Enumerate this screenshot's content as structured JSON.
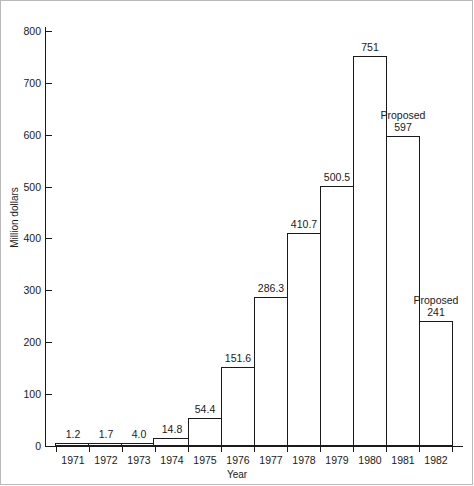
{
  "chart_data": {
    "type": "bar",
    "title": "",
    "xlabel": "Year",
    "ylabel": "Million dollars",
    "categories": [
      "1971",
      "1972",
      "1973",
      "1974",
      "1975",
      "1976",
      "1977",
      "1978",
      "1979",
      "1980",
      "1981",
      "1982"
    ],
    "values": [
      1.2,
      1.7,
      4.0,
      14.8,
      54.4,
      151.6,
      286.3,
      410.7,
      500.5,
      751,
      597,
      241
    ],
    "value_labels": [
      "1.2",
      "1.7",
      "4.0",
      "14.8",
      "54.4",
      "151.6",
      "286.3",
      "410.7",
      "500.5",
      "751",
      "597",
      "241"
    ],
    "annotations": [
      {
        "category": "1981",
        "text": "Proposed"
      },
      {
        "category": "1982",
        "text": "Proposed"
      }
    ],
    "ylim": [
      0,
      800
    ],
    "yticks": [
      0,
      100,
      200,
      300,
      400,
      500,
      600,
      700,
      800
    ],
    "ytick_labels": [
      "0",
      "100",
      "200",
      "300",
      "400",
      "500",
      "600",
      "700",
      "800"
    ],
    "grid": false,
    "legend": "none",
    "bar_style": {
      "fill": "#ffffff",
      "stroke": "#1a1a1a"
    }
  },
  "axis": {
    "y_title": "Million dollars",
    "x_title": "Year"
  },
  "bars": [
    {
      "year": "1971",
      "label": "1.2",
      "note": ""
    },
    {
      "year": "1972",
      "label": "1.7",
      "note": ""
    },
    {
      "year": "1973",
      "label": "4.0",
      "note": ""
    },
    {
      "year": "1974",
      "label": "14.8",
      "note": ""
    },
    {
      "year": "1975",
      "label": "54.4",
      "note": ""
    },
    {
      "year": "1976",
      "label": "151.6",
      "note": ""
    },
    {
      "year": "1977",
      "label": "286.3",
      "note": ""
    },
    {
      "year": "1978",
      "label": "410.7",
      "note": ""
    },
    {
      "year": "1979",
      "label": "500.5",
      "note": ""
    },
    {
      "year": "1980",
      "label": "751",
      "note": ""
    },
    {
      "year": "1981",
      "label": "597",
      "note": "Proposed"
    },
    {
      "year": "1982",
      "label": "241",
      "note": "Proposed"
    }
  ],
  "yticks": [
    {
      "label": "800"
    },
    {
      "label": "700"
    },
    {
      "label": "600"
    },
    {
      "label": "500"
    },
    {
      "label": "400"
    },
    {
      "label": "300"
    },
    {
      "label": "200"
    },
    {
      "label": "100"
    },
    {
      "label": "0"
    }
  ]
}
